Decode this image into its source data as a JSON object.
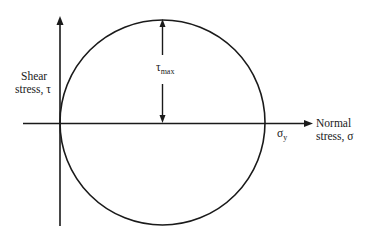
{
  "diagram": {
    "y_axis_label_line1": "Shear",
    "y_axis_label_line2": "stress, τ",
    "x_axis_label_line1": "Normal",
    "x_axis_label_line2": "stress, σ",
    "tau_max_symbol": "τ",
    "tau_max_sub": "max",
    "sigma_y_symbol": "σ",
    "sigma_y_sub": "y",
    "line_color": "#1a1a1a"
  }
}
